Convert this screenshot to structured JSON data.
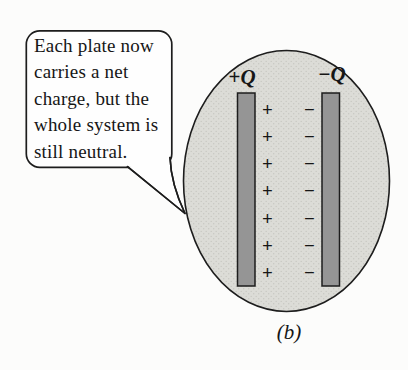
{
  "bubble": {
    "lines": [
      "Each plate now",
      "carries a net",
      "charge, but the",
      "whole system is",
      "still neutral."
    ]
  },
  "diagram": {
    "left_plate_label": {
      "sign": "+",
      "symbol": "Q"
    },
    "right_plate_label": {
      "sign": "−",
      "symbol": "Q"
    },
    "plus_signs": [
      "+",
      "+",
      "+",
      "+",
      "+",
      "+",
      "+"
    ],
    "minus_signs": [
      "−",
      "−",
      "−",
      "−",
      "−",
      "−",
      "−"
    ],
    "caption": "(b)"
  },
  "colors": {
    "background": "#fcfcfb",
    "ellipse_fill": "#dcdcd7",
    "stipple_dot": "#c7c7c1",
    "plate_fill": "#959595",
    "outline": "#1d1d1d",
    "bubble_fill": "#fefefe"
  }
}
